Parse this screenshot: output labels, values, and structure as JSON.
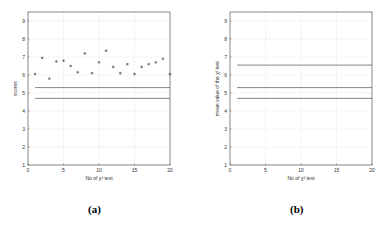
{
  "figure": {
    "captions": [
      "(a)",
      "(b)"
    ]
  },
  "chart_data": [
    {
      "type": "scatter",
      "panel": "(a)",
      "title": "",
      "xlabel": "No of χ² test",
      "ylabel": "scores",
      "xlim": [
        0,
        20
      ],
      "ylim": [
        1,
        9.5
      ],
      "xticks": [
        0,
        5,
        10,
        15,
        20
      ],
      "yticks": [
        1,
        2,
        3,
        4,
        5,
        6,
        7,
        8,
        9
      ],
      "grid": true,
      "x": [
        1,
        2,
        3,
        4,
        5,
        6,
        7,
        8,
        9,
        10,
        11,
        12,
        13,
        14,
        15,
        16,
        17,
        18,
        19,
        20
      ],
      "series": [
        {
          "name": "scores",
          "marker": "*",
          "values": [
            6.05,
            6.95,
            5.8,
            6.75,
            6.8,
            6.5,
            6.15,
            7.2,
            6.1,
            6.7,
            7.35,
            6.45,
            6.1,
            6.6,
            6.05,
            6.45,
            6.6,
            6.7,
            6.9,
            6.05
          ]
        }
      ],
      "hlines": [
        {
          "y": 5.3,
          "x_from": 1,
          "x_to": 20
        },
        {
          "y": 4.7,
          "x_from": 1,
          "x_to": 20
        }
      ]
    },
    {
      "type": "line",
      "panel": "(b)",
      "title": "",
      "xlabel": "No of χ² test",
      "ylabel": "mean value of the χ² test",
      "xlim": [
        0,
        20
      ],
      "ylim": [
        1,
        9.5
      ],
      "xticks": [
        0,
        5,
        10,
        15,
        20
      ],
      "yticks": [
        1,
        2,
        3,
        4,
        5,
        6,
        7,
        8,
        9
      ],
      "grid": true,
      "hlines": [
        {
          "y": 6.55,
          "x_from": 1,
          "x_to": 20
        },
        {
          "y": 5.3,
          "x_from": 1,
          "x_to": 20
        },
        {
          "y": 4.7,
          "x_from": 1,
          "x_to": 20
        }
      ]
    }
  ]
}
